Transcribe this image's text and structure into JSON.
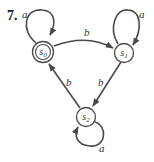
{
  "problem": {
    "number": "7."
  },
  "colors": {
    "stroke": "#4a4a4a",
    "fill": "#ffffff",
    "text": "#333333"
  },
  "states": [
    {
      "id": "s0",
      "label": "s",
      "sub": "0",
      "accepting": true
    },
    {
      "id": "s1",
      "label": "s",
      "sub": "1",
      "accepting": false
    },
    {
      "id": "s2",
      "label": "s",
      "sub": "2",
      "accepting": false
    }
  ],
  "transitions": [
    {
      "from": "s0",
      "to": "s0",
      "label": "a"
    },
    {
      "from": "s0",
      "to": "s1",
      "label": "b"
    },
    {
      "from": "s1",
      "to": "s1",
      "label": "a"
    },
    {
      "from": "s1",
      "to": "s2",
      "label": "b"
    },
    {
      "from": "s2",
      "to": "s2",
      "label": "a"
    },
    {
      "from": "s2",
      "to": "s0",
      "label": "b"
    }
  ]
}
